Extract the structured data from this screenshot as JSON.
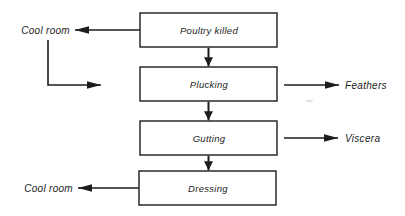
{
  "diagram": {
    "type": "flowchart",
    "boxes": [
      {
        "id": "poultry-killed",
        "label": "Poultry killed"
      },
      {
        "id": "plucking",
        "label": "Plucking"
      },
      {
        "id": "gutting",
        "label": "Gutting"
      },
      {
        "id": "dressing",
        "label": "Dressing"
      }
    ],
    "outputs": {
      "cool_room_top": "Cool room",
      "feathers": "Feathers",
      "viscera": "Viscera",
      "cool_room_bottom": "Cool room"
    },
    "arrows": [
      "Poultry killed -> Plucking",
      "Plucking -> Gutting",
      "Gutting -> Dressing",
      "Poultry killed -> Cool room",
      "Cool room -> (down-right elbow toward Plucking)",
      "Plucking -> Feathers",
      "Gutting -> Viscera",
      "Dressing -> Cool room"
    ],
    "colors": {
      "line": "#1c1c1c",
      "text": "#1c1c1c",
      "box_fill": "#ffffff",
      "background": "#ffffff"
    }
  }
}
